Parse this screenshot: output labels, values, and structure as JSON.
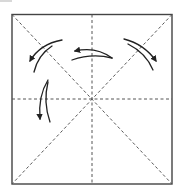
{
  "diagram": {
    "type": "origami-fold-diagram",
    "colors": {
      "background": "#ffffff",
      "line": "#333333",
      "dashed": "#555555",
      "step_mark": "#d8d8d8"
    },
    "square": {
      "x": 12,
      "y": 14,
      "width": 160,
      "height": 170
    },
    "center": {
      "x": 92,
      "y": 99
    },
    "crease_lines": [
      {
        "name": "diagonal-tl-br",
        "style": "dashed"
      },
      {
        "name": "diagonal-tr-bl",
        "style": "dashed"
      },
      {
        "name": "vertical-midline",
        "style": "dashed"
      },
      {
        "name": "horizontal-midline",
        "style": "dashed"
      }
    ],
    "arrows": [
      {
        "name": "arrow-top-left",
        "direction": "down-left"
      },
      {
        "name": "arrow-top-center",
        "direction": "left"
      },
      {
        "name": "arrow-top-right",
        "direction": "down-right"
      },
      {
        "name": "arrow-left",
        "direction": "down"
      }
    ]
  }
}
